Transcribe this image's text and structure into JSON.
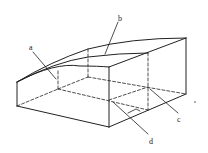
{
  "diagram": {
    "type": "3d-block-with-curved-top",
    "labels": {
      "a": "a",
      "b": "b",
      "c": "c",
      "d": "d",
      "dot": "•"
    },
    "colors": {
      "line": "#222222",
      "background": "#ffffff"
    }
  }
}
